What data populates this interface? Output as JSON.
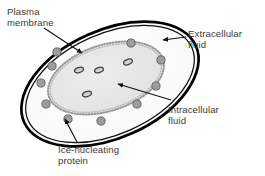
{
  "figure": {
    "background_color": "#ffffff",
    "width": 265,
    "height": 176
  },
  "labels": {
    "plasma_membrane": "Plasma\nmembrane",
    "extracellular_fluid": "Extracellular\nfluid",
    "intracellular_fluid": "Intracellular\nfluid",
    "ice_nucleating_protein": "Ice-nucleating\nprotein"
  },
  "colors": {
    "text": "#3a3a3a",
    "membrane_stroke": "#000000",
    "cytoplasm_fill": "#fbfbfb",
    "nucleus_fill": "#e8e8e8",
    "nucleus_dot_border": "#9a9a9a",
    "protein_dot_fill": "#9d9d9d",
    "protein_dot_stroke": "#5a5a5a",
    "organelle_fill": "#d8d8d8",
    "organelle_stroke": "#4a4a4a",
    "leader_line": "#1a1a1a"
  },
  "structures": {
    "plasma_membrane": {
      "shape": "ellipse",
      "cx": 110,
      "cy": 84,
      "rx": 94,
      "ry": 54,
      "rotation_deg": -24,
      "stroke_width": 2.6,
      "inner_offset": 3.2
    },
    "intracellular_region": {
      "shape": "ellipse",
      "cx": 106,
      "cy": 78,
      "rx": 60,
      "ry": 33,
      "rotation_deg": -18,
      "border_style": "dotted"
    },
    "ice_nucleating_proteins": {
      "count": 10,
      "radius": 4.1,
      "positions": [
        {
          "x": 131,
          "y": 43
        },
        {
          "x": 161,
          "y": 60
        },
        {
          "x": 156,
          "y": 86
        },
        {
          "x": 137,
          "y": 104
        },
        {
          "x": 101,
          "y": 121
        },
        {
          "x": 68,
          "y": 119
        },
        {
          "x": 46,
          "y": 104
        },
        {
          "x": 41,
          "y": 83
        },
        {
          "x": 52,
          "y": 66
        },
        {
          "x": 57,
          "y": 52
        }
      ]
    },
    "organelles": {
      "count": 4,
      "rx": 4.6,
      "ry": 2.5,
      "positions": [
        {
          "x": 128,
          "y": 62,
          "rot": -22
        },
        {
          "x": 99,
          "y": 70,
          "rot": -20
        },
        {
          "x": 79,
          "y": 70,
          "rot": -20
        },
        {
          "x": 87,
          "y": 94,
          "rot": -20
        }
      ]
    }
  },
  "leaders": {
    "plasma_membrane": {
      "from": {
        "x": 44,
        "y": 28
      },
      "to": {
        "x": 82,
        "y": 53
      },
      "arrowhead": true
    },
    "extracellular_fluid": {
      "from": {
        "x": 186,
        "y": 36
      },
      "to": {
        "x": 162,
        "y": 40
      },
      "arrowhead": true
    },
    "intracellular_fluid": {
      "from": {
        "x": 171,
        "y": 100
      },
      "to": {
        "x": 117,
        "y": 84
      },
      "arrowhead": true
    },
    "ice_nucleating_protein": {
      "from": {
        "x": 76,
        "y": 142
      },
      "to": {
        "x": 64,
        "y": 119
      },
      "arrowhead": true
    }
  }
}
